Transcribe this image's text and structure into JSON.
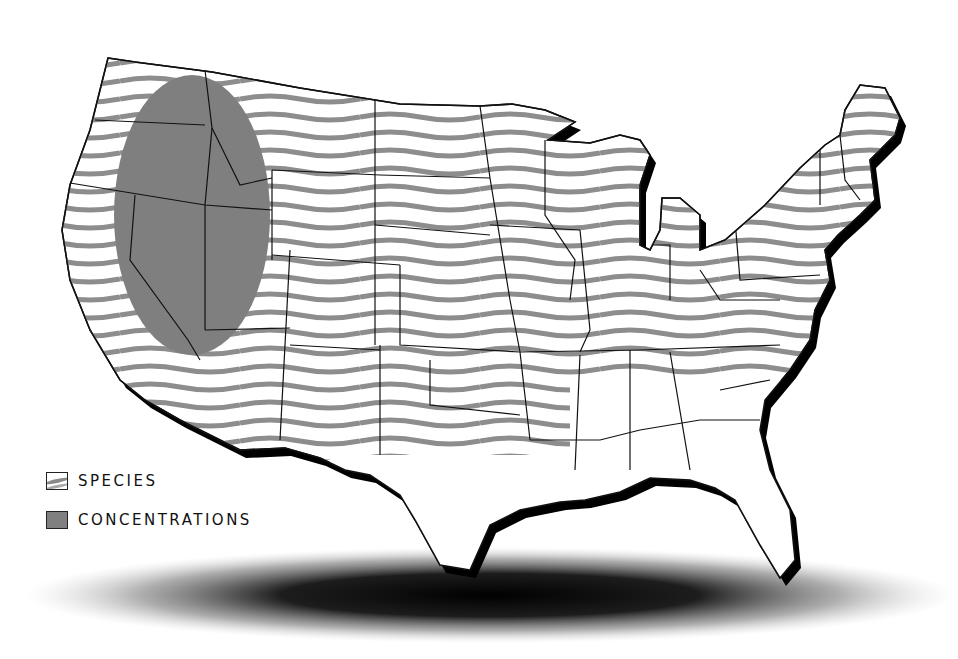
{
  "map": {
    "title": "",
    "region": "Contiguous United States",
    "colors": {
      "species_hatch": "#8a8a8a",
      "concentration_fill": "#7f7f7f",
      "border": "#111111",
      "coast_shadow": "#000000",
      "background": "#ffffff"
    },
    "concentration_area": "Oregon, Idaho, Nevada, western Utah, northern California region"
  },
  "legend": {
    "items": [
      {
        "key": "species",
        "label": "SPECIES",
        "icon": "wavy-hatch-swatch-icon"
      },
      {
        "key": "concentrations",
        "label": "CONCENTRATIONS",
        "icon": "solid-gray-swatch-icon"
      }
    ]
  }
}
